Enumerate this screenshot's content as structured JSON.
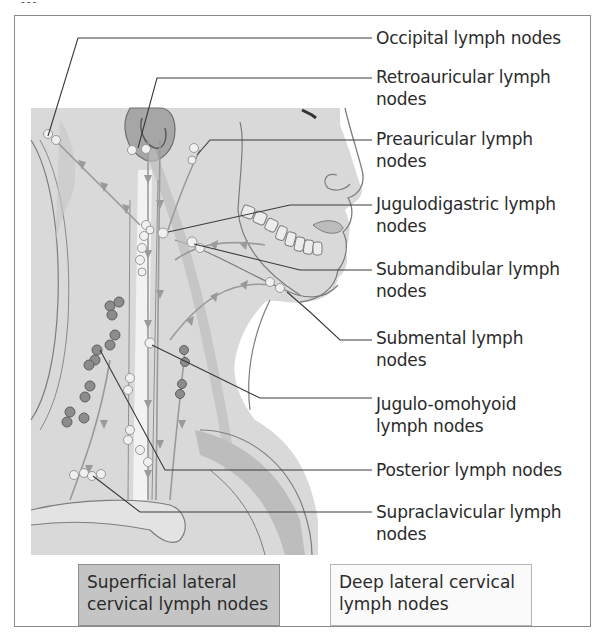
{
  "title_fragment": "...",
  "labels": [
    {
      "id": "occipital",
      "text": "Occipital lymph nodes",
      "lines": [
        "Occipital lymph nodes"
      ],
      "top": 34
    },
    {
      "id": "retroauricular",
      "text": "Retroauricular lymph nodes",
      "lines": [
        "Retroauricular lymph",
        "nodes"
      ],
      "top": 71
    },
    {
      "id": "preauricular",
      "text": "Preauricular lymph nodes",
      "lines": [
        "Preauricular lymph",
        "nodes"
      ],
      "top": 131
    },
    {
      "id": "jugulodigastric",
      "text": "Jugulodigastric lymph nodes",
      "lines": [
        "Jugulodigastric lymph",
        "nodes"
      ],
      "top": 195
    },
    {
      "id": "submandibular",
      "text": "Submandibular lymph nodes",
      "lines": [
        "Submandibular lymph",
        "nodes"
      ],
      "top": 259
    },
    {
      "id": "submental",
      "text": "Submental lymph nodes",
      "lines": [
        "Submental lymph",
        "nodes"
      ],
      "top": 324
    },
    {
      "id": "jugulo-omohyoid",
      "text": "Jugulo-omohyoid lymph nodes",
      "lines": [
        "Jugulo-omohyoid",
        "lymph nodes"
      ],
      "top": 390
    },
    {
      "id": "posterior",
      "text": "Posterior lymph nodes",
      "lines": [
        "Posterior lymph nodes"
      ],
      "top": 458
    },
    {
      "id": "supraclavicular",
      "text": "Supraclavicular lymph nodes",
      "lines": [
        "Supraclavicular lymph",
        "nodes"
      ],
      "top": 497
    }
  ],
  "legend": {
    "superficial": {
      "line1": "Superficial lateral",
      "line2": "cervical lymph nodes",
      "color": "#c4c4c4"
    },
    "deep": {
      "line1": "Deep lateral cervical",
      "line2": "lymph nodes",
      "color": "#fafafa"
    }
  },
  "colors": {
    "skin": "#d9d9d9",
    "outline": "#7d7d7d",
    "leader_line": "#3a3a3a",
    "superficial_node": "#8c8c8c",
    "deep_node": "#f0f0f0",
    "arrow": "#9a9a9a"
  }
}
